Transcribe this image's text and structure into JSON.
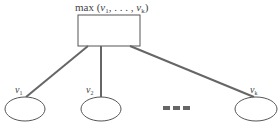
{
  "diagram": {
    "root": {
      "label_prefix": "max (",
      "label_v": "v",
      "label_sub1": "1",
      "label_mid": ", . . . , ",
      "label_subk": "k",
      "label_suffix": ")"
    },
    "children": [
      {
        "v": "v",
        "sub": "1"
      },
      {
        "v": "v",
        "sub": "2"
      },
      {
        "v": "v",
        "sub": "k"
      }
    ],
    "ellipsis": "•••",
    "colors": {
      "edge": "#666666",
      "outline": "#555555",
      "dots": "#666666"
    }
  }
}
